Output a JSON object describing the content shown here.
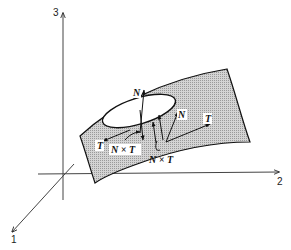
{
  "diagram": {
    "type": "3d-surface-frame",
    "colors": {
      "background": "#ffffff",
      "axis_stroke": "#333333",
      "surface_fill": "#c8c8c8",
      "surface_stroke": "#111111",
      "vector_stroke": "#111111"
    },
    "axes": [
      {
        "id": "axis-1",
        "label": "1",
        "direction": "toward-viewer-lower-left"
      },
      {
        "id": "axis-2",
        "label": "2",
        "direction": "right"
      },
      {
        "id": "axis-3",
        "label": "3",
        "direction": "up"
      }
    ],
    "surface": {
      "description": "shaded curved surface patch with a closed elliptical curve drawn on it",
      "curve": "ellipse"
    },
    "vector_labels": [
      {
        "id": "N-top",
        "text": "N"
      },
      {
        "id": "N-right",
        "text": "N"
      },
      {
        "id": "T-left",
        "text": "T"
      },
      {
        "id": "T-right",
        "text": "T"
      },
      {
        "id": "NxT-left",
        "text": "N × T"
      },
      {
        "id": "NxT-bottom",
        "text": "N × T"
      }
    ]
  }
}
